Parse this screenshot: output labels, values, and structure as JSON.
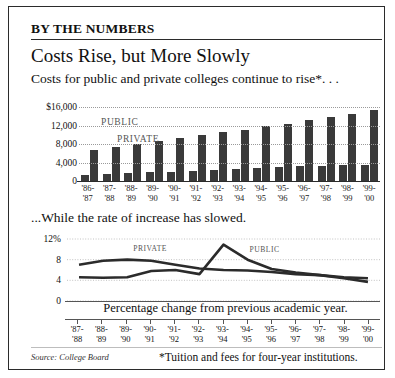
{
  "header": {
    "kicker": "BY THE NUMBERS",
    "headline": "Costs Rise, but More Slowly",
    "deck_top": "Costs for public and private colleges continue to rise*. . .",
    "deck_bottom": "...While the rate of increase has slowed."
  },
  "footer": {
    "source": "Source: College Board",
    "note": "*Tuition and fees for four-year institutions."
  },
  "colors": {
    "bar": "#3a3a3a",
    "line": "#2b2b2b",
    "grid": "#9a9a9a",
    "border": "#2b2b2b"
  },
  "chart_data": [
    {
      "type": "bar",
      "title": "Costs for public and private colleges continue to rise*. . .",
      "xlabel": "",
      "ylabel": "",
      "ylim": [
        0,
        16000
      ],
      "yticks": [
        0,
        4000,
        8000,
        12000,
        16000
      ],
      "ytick_labels": [
        "0",
        "4,000",
        "8,000",
        "12,000",
        "$16,000"
      ],
      "grid": true,
      "legend": [
        "PUBLIC",
        "PRIVATE"
      ],
      "legend_position": "inside-top",
      "categories": [
        "'86-\n'87",
        "'87-\n'88",
        "'88-\n'89",
        "'89-\n'90",
        "'90-\n'91",
        "'91-\n'92",
        "'92-\n'93",
        "'93-\n'94",
        "'94-\n'95",
        "'95-\n'96",
        "'96-\n'97",
        "'97-\n'98",
        "'98-\n'99",
        "'99-\n'00"
      ],
      "series": [
        {
          "name": "PUBLIC",
          "values": [
            1400,
            1600,
            1700,
            1850,
            2000,
            2150,
            2400,
            2650,
            2850,
            3000,
            3150,
            3300,
            3400,
            3500
          ]
        },
        {
          "name": "PRIVATE",
          "values": [
            6700,
            7400,
            8000,
            8700,
            9400,
            10000,
            10500,
            11000,
            11800,
            12400,
            13100,
            13800,
            14500,
            15400
          ]
        }
      ]
    },
    {
      "type": "line",
      "title": "...While the rate of increase has slowed.",
      "caption": "Percentage change from previous academic year.",
      "xlabel": "",
      "ylabel": "",
      "ylim": [
        0,
        12
      ],
      "yticks": [
        0,
        4,
        8,
        12
      ],
      "ytick_labels": [
        "0",
        "4",
        "8",
        "12%"
      ],
      "grid": true,
      "legend": [
        "PRIVATE",
        "PUBLIC"
      ],
      "x": [
        "'87-\n'88",
        "'88-\n'89",
        "'89-\n'90",
        "'90-\n'91",
        "'91-\n'92",
        "'92-\n'93",
        "'93-\n'94",
        "'94-\n'95",
        "'95-\n'96",
        "'96-\n'97",
        "'97-\n'98",
        "'98-\n'99",
        "'99-\n'00"
      ],
      "series": [
        {
          "name": "PRIVATE",
          "values": [
            7.0,
            7.8,
            8.0,
            7.8,
            7.0,
            6.3,
            6.0,
            5.9,
            5.6,
            5.2,
            5.0,
            4.6,
            4.4
          ]
        },
        {
          "name": "PUBLIC",
          "values": [
            4.6,
            4.5,
            4.6,
            5.8,
            6.0,
            5.2,
            10.9,
            8.0,
            6.2,
            5.5,
            5.0,
            4.4,
            3.7
          ]
        }
      ]
    }
  ]
}
